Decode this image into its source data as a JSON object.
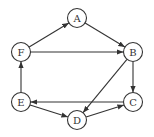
{
  "diagram": {
    "type": "directed-graph",
    "node_radius": 9.5,
    "stroke_color": "#333333",
    "nodes": [
      {
        "id": "A",
        "label": "A",
        "x": 77,
        "y": 18
      },
      {
        "id": "B",
        "label": "B",
        "x": 133,
        "y": 52
      },
      {
        "id": "C",
        "label": "C",
        "x": 133,
        "y": 102
      },
      {
        "id": "D",
        "label": "D",
        "x": 77,
        "y": 120
      },
      {
        "id": "E",
        "label": "E",
        "x": 21,
        "y": 102
      },
      {
        "id": "F",
        "label": "F",
        "x": 21,
        "y": 52
      }
    ],
    "edges": [
      {
        "from": "F",
        "to": "A"
      },
      {
        "from": "A",
        "to": "B"
      },
      {
        "from": "F",
        "to": "B"
      },
      {
        "from": "B",
        "to": "C"
      },
      {
        "from": "B",
        "to": "D"
      },
      {
        "from": "C",
        "to": "E"
      },
      {
        "from": "E",
        "to": "D"
      },
      {
        "from": "D",
        "to": "C"
      },
      {
        "from": "E",
        "to": "F"
      }
    ]
  }
}
